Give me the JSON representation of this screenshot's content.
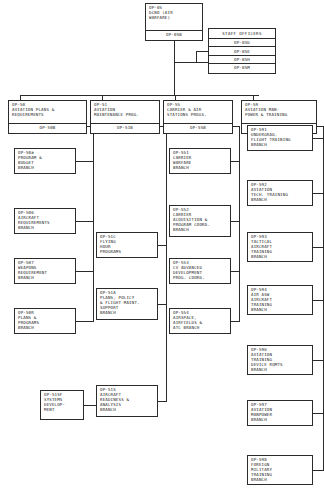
{
  "chart_title": "OP-05 DCNO (Air Warfare) Organization Chart",
  "root": {
    "code": "OP-05",
    "line2": "DCNO (AIR",
    "line3": "WARFARE)",
    "deputy": "OP-05B"
  },
  "staff": {
    "title": "STAFF OFFICERS",
    "rows": [
      "OP-05D",
      "OP-05E",
      "OP-05H",
      "OP-05M"
    ]
  },
  "divisions": [
    {
      "code": "OP-50",
      "line2": "AVIATION PLANS &",
      "line3": "REQUIREMENTS",
      "deputy": "OP-50B",
      "branches": [
        {
          "code": "OP-50a",
          "lines": [
            "PROGRAM &",
            "BUDGET",
            "BRANCH"
          ]
        },
        {
          "code": "OP-506",
          "lines": [
            "AIRCRAFT",
            "REQUIREMENTS",
            "BRANCH"
          ]
        },
        {
          "code": "OP-507",
          "lines": [
            "WEAPONS",
            "REQUIREMENT",
            "BRANCH"
          ]
        },
        {
          "code": "OP-50R",
          "lines": [
            "PLANS &",
            "PROGRAMS",
            "BRANCH"
          ]
        }
      ]
    },
    {
      "code": "OP-51",
      "line2": "AVIATION",
      "line3": "MAINTENANCE PROG.",
      "deputy": "OP-51B",
      "branches": [
        {
          "code": "OP-51C",
          "lines": [
            "FLYING",
            "HOUR",
            "PROGRAMS"
          ]
        },
        {
          "code": "OP-51A",
          "lines": [
            "PLANS, POLICY",
            "& FLIGHT MAINT.",
            "SUPPORT",
            "BRANCH"
          ]
        },
        {
          "code": "OP-51S",
          "lines": [
            "AIRCRAFT",
            "READINESS &",
            "ANALYSIS",
            "BRANCH"
          ]
        }
      ]
    },
    {
      "code": "OP-55",
      "line2": "CARRIER & AIR",
      "line3": "STATIONS PROGS.",
      "deputy": "OP-55B",
      "branches": [
        {
          "code": "OP-551",
          "lines": [
            "CARRIER",
            "WARFARE",
            "BRANCH"
          ]
        },
        {
          "code": "OP-552",
          "lines": [
            "CARRIER",
            "ACQUISITION &",
            "PROGRAM COORD.",
            "BRANCH"
          ]
        },
        {
          "code": "OP-553",
          "lines": [
            "CV ADVANCED",
            "DEVELOPMENT",
            "PROG. COORD."
          ]
        },
        {
          "code": "OP-554",
          "lines": [
            "AIRSPACE,",
            "AIRFIELDS &",
            "ATC BRANCH"
          ]
        }
      ]
    },
    {
      "code": "OP-59",
      "line2": "AVIATION MAN-",
      "line3": "POWER & TRAINING",
      "deputy": "OP-59B",
      "branches": [
        {
          "code": "OP-591",
          "lines": [
            "UNDERGRAD.",
            "FLIGHT TRAINING",
            "BRANCH"
          ]
        },
        {
          "code": "OP-592",
          "lines": [
            "AVIATION",
            "TECH. TRAINING",
            "BRANCH"
          ]
        },
        {
          "code": "OP-593",
          "lines": [
            "TACTICAL",
            "AIRCRAFT",
            "TRAINING",
            "BRANCH"
          ]
        },
        {
          "code": "OP-594",
          "lines": [
            "AIR ASW",
            "AIRCRAFT",
            "TRAINING",
            "BRANCH"
          ]
        },
        {
          "code": "OP-596",
          "lines": [
            "AVIATION",
            "TRAINING",
            "DEVICE RQMTS",
            "BRANCH"
          ]
        },
        {
          "code": "OP-597",
          "lines": [
            "AVIATION",
            "MANPOWER",
            "BRANCH"
          ]
        },
        {
          "code": "OP-598",
          "lines": [
            "FOREIGN",
            "MILITARY",
            "TRAINING",
            "BRANCH"
          ]
        }
      ]
    }
  ],
  "sub_branch": {
    "code": "OP-51SF",
    "lines": [
      "SYSTEMS",
      "DEVELOP-",
      "MENT"
    ],
    "parent": "OP-51S"
  },
  "colors": {
    "ink": "#2b2b2b",
    "paper": "#ffffff"
  }
}
